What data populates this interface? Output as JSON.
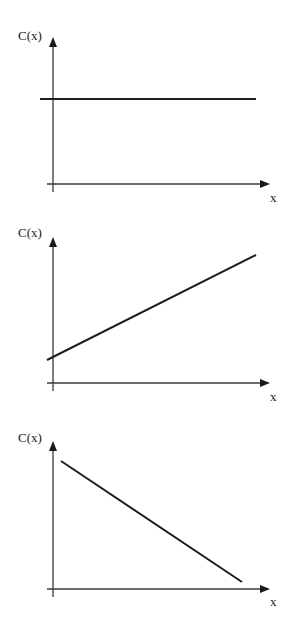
{
  "chart_data": [
    {
      "type": "line",
      "title": "",
      "description": "Constant function",
      "xlabel": "x",
      "ylabel": "C(x)",
      "grid": false,
      "legend": null,
      "x": [
        0,
        1
      ],
      "series": [
        {
          "name": "C(x)",
          "values": [
            0.7,
            0.7
          ],
          "trend": "constant"
        }
      ],
      "layout": {
        "origin": [
          53,
          184
        ],
        "y_axis_top": 37,
        "y_axis_bottom": 192,
        "x_axis_left": 47,
        "x_axis_right": 270,
        "ylabel_pos": [
          18,
          40
        ],
        "xlabel_pos": [
          270,
          202
        ],
        "line": [
          [
            40,
            99
          ],
          [
            256,
            99
          ]
        ]
      }
    },
    {
      "type": "line",
      "title": "",
      "description": "Increasing linear function with positive intercept",
      "xlabel": "x",
      "ylabel": "C(x)",
      "grid": false,
      "legend": null,
      "x": [
        0,
        1
      ],
      "series": [
        {
          "name": "C(x)",
          "values": [
            0.17,
            0.9
          ],
          "trend": "increasing"
        }
      ],
      "layout": {
        "origin": [
          53,
          383
        ],
        "y_axis_top": 237,
        "y_axis_bottom": 391,
        "x_axis_left": 47,
        "x_axis_right": 270,
        "ylabel_pos": [
          18,
          237
        ],
        "xlabel_pos": [
          270,
          401
        ],
        "line": [
          [
            47,
            360
          ],
          [
            256,
            255
          ]
        ]
      }
    },
    {
      "type": "line",
      "title": "",
      "description": "Decreasing linear function",
      "xlabel": "x",
      "ylabel": "C(x)",
      "grid": false,
      "legend": null,
      "x": [
        0,
        1
      ],
      "series": [
        {
          "name": "C(x)",
          "values": [
            0.9,
            0.05
          ],
          "trend": "decreasing"
        }
      ],
      "layout": {
        "origin": [
          53,
          589
        ],
        "y_axis_top": 441,
        "y_axis_bottom": 597,
        "x_axis_left": 47,
        "x_axis_right": 270,
        "ylabel_pos": [
          18,
          442
        ],
        "xlabel_pos": [
          270,
          606
        ],
        "line": [
          [
            61,
            461
          ],
          [
            242,
            582
          ]
        ]
      }
    }
  ],
  "colors": {
    "axis": "#3a3a3a",
    "line": "#1e1e1e",
    "background": "#ffffff"
  }
}
